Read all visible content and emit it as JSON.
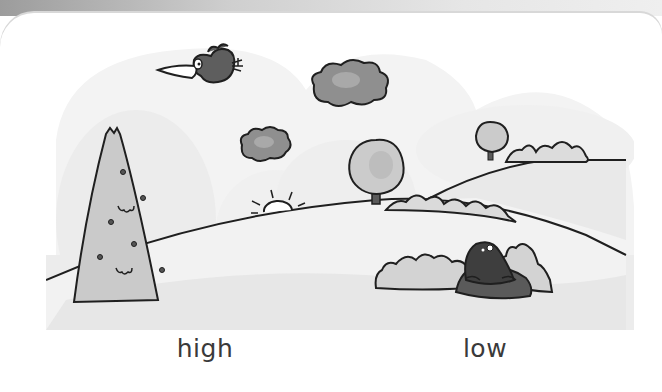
{
  "worksheet": {
    "topic": "Opposites",
    "scene": {
      "description": "Hilly landscape with a bird flying high and a mole low in a molehill",
      "elements": [
        {
          "name": "bird",
          "position": "high in the sky"
        },
        {
          "name": "cloud-large",
          "position": "upper center"
        },
        {
          "name": "cloud-small",
          "position": "center"
        },
        {
          "name": "sun",
          "position": "setting behind hill"
        },
        {
          "name": "tall-conifer-tree",
          "position": "left"
        },
        {
          "name": "round-tree",
          "position": "center hill"
        },
        {
          "name": "round-tree-far",
          "position": "right hill"
        },
        {
          "name": "bushes",
          "position": "right hill"
        },
        {
          "name": "mole",
          "position": "low in molehill between bushes"
        }
      ]
    },
    "labels": {
      "high": "high",
      "low": "low"
    },
    "colors": {
      "sky_blob": "#f2f2f2",
      "hill_fill": "#ededed",
      "foliage": "#c9c9c9",
      "cloud": "#8a8a8a",
      "bird": "#5e5e5e",
      "mole": "#3e3e3e",
      "molehill": "#5a5a5a",
      "outline": "#1f1f1f",
      "text": "#3a3a3a"
    }
  }
}
